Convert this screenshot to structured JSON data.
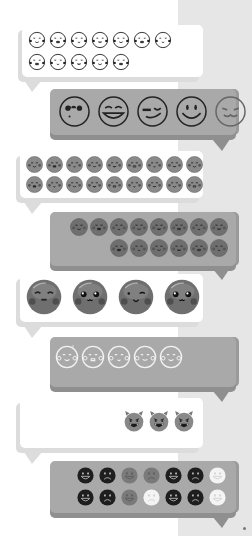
{
  "colors": {
    "background": "#ffffff",
    "side_panel": "#e6e6e6",
    "bubble_white": "#ffffff",
    "bubble_gray": "#a9a9a9",
    "bubble_shadow": "#dcdcdc",
    "emoji_dark": "#1e1e1e",
    "emoji_mid": "#7a7a7a",
    "emoji_light": "#f4f4f4"
  },
  "bubbles": [
    {
      "id": 1,
      "side": "left",
      "style": "white",
      "description": "outline kawaii faces",
      "rows": [
        7,
        5
      ],
      "emoji_style": "outline-kawaii"
    },
    {
      "id": 2,
      "side": "right",
      "style": "gray",
      "description": "large outline expressive faces",
      "rows": [
        5
      ],
      "emoji_style": "outline-large",
      "faces": [
        "heart-eyes",
        "laughing",
        "winking-tongue",
        "smiling",
        "squinting"
      ]
    },
    {
      "id": 3,
      "side": "left",
      "style": "white",
      "description": "small gray kawaii faces",
      "rows": [
        9,
        9
      ],
      "emoji_style": "gray-small"
    },
    {
      "id": 4,
      "side": "right",
      "style": "gray",
      "description": "small dark kawaii faces",
      "rows": [
        8,
        6
      ],
      "emoji_style": "dark-small"
    },
    {
      "id": 5,
      "side": "left",
      "style": "white",
      "description": "large glossy kawaii faces",
      "rows": [
        4
      ],
      "emoji_style": "glossy-large",
      "faces": [
        "content",
        "sparkle-eyes",
        "wink",
        "sparkle-eyes"
      ]
    },
    {
      "id": 6,
      "side": "right",
      "style": "gray",
      "description": "white outline kawaii faces",
      "rows": [
        5
      ],
      "emoji_style": "white-outline"
    },
    {
      "id": 7,
      "side": "right-aligned",
      "style": "white",
      "description": "devil faces",
      "rows": [
        3
      ],
      "emoji_style": "devil"
    },
    {
      "id": 8,
      "side": "right",
      "style": "gray",
      "description": "happy and sad flat faces",
      "rows": [
        7,
        7
      ],
      "emoji_style": "flat",
      "grid": [
        [
          "dark-happy",
          "dark-sad",
          "mid-happy",
          "mid-sad",
          "dark-happy",
          "dark-sad",
          "light-happy"
        ],
        [
          "dark-happy",
          "dark-sad",
          "mid-happy",
          "light-sad",
          "dark-happy",
          "dark-sad",
          "light-happy"
        ]
      ]
    }
  ]
}
